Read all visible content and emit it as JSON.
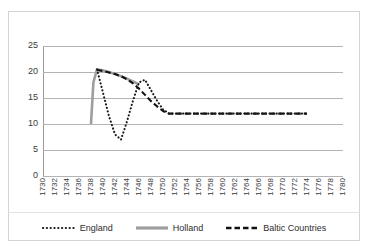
{
  "chart_data": {
    "type": "line",
    "title": "",
    "subtitle": "",
    "xlabel": "",
    "ylabel": "",
    "xlim": [
      1730,
      1780
    ],
    "ylim": [
      0,
      25
    ],
    "ytick_step": 5,
    "xtick_step": 2,
    "grid": "horizontal",
    "legend_position": "bottom",
    "x_tick_labels": [
      "1730",
      "1732",
      "1734",
      "1736",
      "1738",
      "1740",
      "1742",
      "1744",
      "1746",
      "1748",
      "1750",
      "1752",
      "1754",
      "1756",
      "1758",
      "1760",
      "1762",
      "1764",
      "1766",
      "1768",
      "1770",
      "1772",
      "1774",
      "1776",
      "1778",
      "1780"
    ],
    "y_tick_labels": [
      "0",
      "5",
      "10",
      "15",
      "20",
      "25"
    ],
    "categories": [
      1730,
      1732,
      1734,
      1736,
      1738,
      1740,
      1742,
      1744,
      1746,
      1748,
      1750,
      1752,
      1754,
      1756,
      1758,
      1760,
      1762,
      1764,
      1766,
      1768,
      1770,
      1772,
      1774,
      1776,
      1778,
      1780
    ],
    "series": [
      {
        "name": "England",
        "style": "dotted",
        "color": "#1a1a1a",
        "x": [
          1739,
          1740,
          1741,
          1742,
          1743,
          1744,
          1745,
          1746,
          1747,
          1748,
          1749,
          1750,
          1751,
          1774
        ],
        "values": [
          20.5,
          16.0,
          11.5,
          8.0,
          7.0,
          10.5,
          14.5,
          18.0,
          18.5,
          16.5,
          14.5,
          12.8,
          12.0,
          12.0
        ]
      },
      {
        "name": "Holland",
        "style": "solid",
        "color": "#9e9e9e",
        "x": [
          1738,
          1738.4,
          1739,
          1740,
          1741,
          1742,
          1743,
          1744,
          1745,
          1746
        ],
        "values": [
          10.0,
          18.0,
          20.5,
          20.3,
          20.0,
          19.6,
          19.2,
          18.7,
          18.2,
          17.6
        ]
      },
      {
        "name": "Baltic Countries",
        "style": "dashed",
        "color": "#111111",
        "x": [
          1739,
          1740,
          1741,
          1742,
          1743,
          1744,
          1745,
          1746,
          1747,
          1748,
          1749,
          1750,
          1751,
          1774
        ],
        "values": [
          20.4,
          20.2,
          19.9,
          19.6,
          19.2,
          18.6,
          17.8,
          16.8,
          15.6,
          14.4,
          13.4,
          12.5,
          12.0,
          12.0
        ]
      }
    ]
  },
  "legend": {
    "entries": [
      {
        "label": "England",
        "icon": "dotted-line-swatch"
      },
      {
        "label": "Holland",
        "icon": "solid-line-swatch"
      },
      {
        "label": "Baltic Countries",
        "icon": "dashed-line-swatch"
      }
    ]
  },
  "colors": {
    "england": "#1a1a1a",
    "holland": "#9e9e9e",
    "baltic": "#111111",
    "gridline": "#b3b3b3",
    "frame": "#d4d4d4",
    "text": "#3a3a3a"
  }
}
